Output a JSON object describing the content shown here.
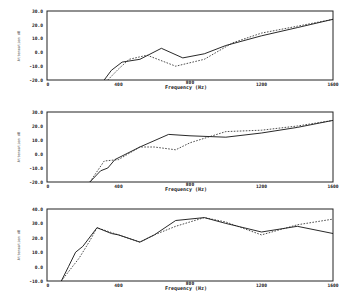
{
  "chart_data": [
    {
      "type": "line",
      "title": "",
      "xlabel": "Frequency (Hz)",
      "ylabel": "Attenuation dB",
      "xlim": [
        0,
        1600
      ],
      "ylim": [
        -20,
        30
      ],
      "x_ticks": [
        "0",
        "400",
        "800",
        "1200",
        "1600"
      ],
      "y_ticks": [
        "30.0",
        "20.0",
        "10.0",
        "0.0",
        "-10.0",
        "-20.0"
      ],
      "grid": false,
      "series": [
        {
          "name": "solid",
          "style": "solid",
          "x": [
            320,
            360,
            420,
            520,
            640,
            760,
            880,
            1000,
            1200,
            1400,
            1600
          ],
          "y": [
            -20,
            -13,
            -7,
            -5,
            3,
            -4,
            -1,
            5,
            12,
            18,
            24
          ]
        },
        {
          "name": "dashed",
          "style": "dashed",
          "x": [
            340,
            400,
            460,
            560,
            720,
            880,
            1040,
            1200,
            1400,
            1600
          ],
          "y": [
            -20,
            -12,
            -5,
            -2,
            -10,
            -5,
            7,
            14,
            19,
            24
          ]
        }
      ]
    },
    {
      "type": "line",
      "title": "",
      "xlabel": "Frequency (Hz)",
      "ylabel": "Attenuation dB",
      "xlim": [
        0,
        1600
      ],
      "ylim": [
        -20,
        30
      ],
      "x_ticks": [
        "0",
        "400",
        "800",
        "1200",
        "1600"
      ],
      "y_ticks": [
        "30.0",
        "20.0",
        "10.0",
        "0.0",
        "-10.0",
        "-20.0"
      ],
      "grid": false,
      "series": [
        {
          "name": "solid",
          "style": "solid",
          "x": [
            240,
            300,
            340,
            380,
            520,
            680,
            800,
            1000,
            1200,
            1400,
            1600
          ],
          "y": [
            -20,
            -12,
            -10,
            -4,
            5,
            14,
            13,
            12,
            15,
            19,
            24
          ]
        },
        {
          "name": "dashed",
          "style": "dashed",
          "x": [
            240,
            320,
            400,
            520,
            600,
            720,
            800,
            1000,
            1200,
            1400,
            1600
          ],
          "y": [
            -20,
            -5,
            -4,
            5,
            5,
            3,
            8,
            16,
            17,
            20,
            24
          ]
        }
      ]
    },
    {
      "type": "line",
      "title": "",
      "xlabel": "Frequency (Hz)",
      "ylabel": "Attenuation dB",
      "xlim": [
        0,
        1600
      ],
      "ylim": [
        -10,
        40
      ],
      "x_ticks": [
        "0",
        "400",
        "800",
        "1200",
        "1600"
      ],
      "y_ticks": [
        "40.0",
        "30.0",
        "20.0",
        "10.0",
        "0.0",
        "-10.0"
      ],
      "grid": false,
      "series": [
        {
          "name": "solid",
          "style": "solid",
          "x": [
            80,
            120,
            160,
            200,
            280,
            360,
            400,
            520,
            600,
            720,
            880,
            1000,
            1200,
            1400,
            1600
          ],
          "y": [
            -10,
            0,
            10,
            14,
            27,
            23,
            22,
            17,
            22,
            32,
            34,
            30,
            24,
            28,
            23
          ]
        },
        {
          "name": "dashed",
          "style": "dashed",
          "x": [
            80,
            180,
            240,
            280,
            400,
            520,
            600,
            720,
            880,
            1000,
            1200,
            1400,
            1600
          ],
          "y": [
            -10,
            6,
            18,
            27,
            22,
            17,
            22,
            28,
            34,
            31,
            22,
            29,
            33
          ]
        }
      ]
    }
  ],
  "plots": [
    {
      "ylabel": "Attenuation dB",
      "xlabel": "Frequency (Hz)",
      "yticks": [
        "30.0",
        "20.0",
        "10.0",
        "0.0",
        "-10.0",
        "-20.0"
      ],
      "xticks": [
        "0",
        "400",
        "800",
        "1200",
        "1600"
      ]
    },
    {
      "ylabel": "Attenuation dB",
      "xlabel": "Frequency (Hz)",
      "yticks": [
        "30.0",
        "20.0",
        "10.0",
        "0.0",
        "-10.0",
        "-20.0"
      ],
      "xticks": [
        "0",
        "400",
        "800",
        "1200",
        "1600"
      ]
    },
    {
      "ylabel": "Attenuation dB",
      "xlabel": "Frequency (Hz)",
      "yticks": [
        "40.0",
        "30.0",
        "20.0",
        "10.0",
        "0.0",
        "-10.0"
      ],
      "xticks": [
        "0",
        "400",
        "800",
        "1200",
        "1600"
      ]
    }
  ]
}
